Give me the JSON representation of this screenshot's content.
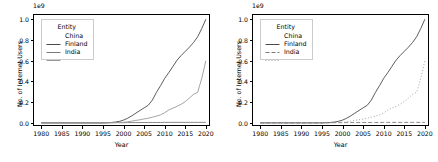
{
  "figure": {
    "panels": [
      {
        "name": "left-panel",
        "style_mode": "all-solid"
      },
      {
        "name": "right-panel",
        "style_mode": "per-entity-dash"
      }
    ]
  },
  "legend": {
    "title": "Entity",
    "entries": [
      {
        "label": "China",
        "color": "#4a4a4a",
        "dash_left": "none",
        "dash_right": "none"
      },
      {
        "label": "Finland",
        "color": "#7a7a7a",
        "dash_left": "none",
        "dash_right": "4,2"
      },
      {
        "label": "India",
        "color": "#9a9a9a",
        "dash_left": "none",
        "dash_right": "1,2"
      }
    ]
  },
  "chart_data": {
    "type": "line",
    "title": "",
    "xlabel": "Year",
    "ylabel": "No. of Internet Users",
    "y_offset_text": "1e9",
    "y_scale": 1000000000,
    "xlim": [
      1978,
      2021
    ],
    "ylim": [
      -0.03,
      1.05
    ],
    "grid": false,
    "legend_position": "upper left",
    "xticks": [
      1980,
      1985,
      1990,
      1995,
      2000,
      2005,
      2010,
      2015,
      2020
    ],
    "xtick_labels": [
      "1980",
      "1985",
      "1990",
      "1995",
      "2000",
      "2005",
      "2010",
      "2015",
      "2020"
    ],
    "yticks": [
      0.0,
      0.2,
      0.4,
      0.6,
      0.8,
      1.0
    ],
    "ytick_labels": [
      "0.0",
      "0.2",
      "0.4",
      "0.6",
      "0.8",
      "1.0"
    ],
    "x": [
      1980,
      1985,
      1990,
      1995,
      1996,
      1997,
      1998,
      1999,
      2000,
      2001,
      2002,
      2003,
      2004,
      2005,
      2006,
      2007,
      2008,
      2009,
      2010,
      2011,
      2012,
      2013,
      2014,
      2015,
      2016,
      2017,
      2018,
      2019,
      2020
    ],
    "series": [
      {
        "name": "China",
        "values": [
          0.0,
          0.0,
          0.0,
          0.0,
          0.002,
          0.004,
          0.008,
          0.015,
          0.027,
          0.045,
          0.068,
          0.094,
          0.12,
          0.145,
          0.17,
          0.22,
          0.295,
          0.36,
          0.43,
          0.485,
          0.545,
          0.605,
          0.65,
          0.69,
          0.73,
          0.775,
          0.83,
          0.91,
          1.0
        ]
      },
      {
        "name": "Finland",
        "values": [
          0.0,
          0.0,
          0.0,
          0.0,
          0.001,
          0.001,
          0.002,
          0.002,
          0.002,
          0.003,
          0.003,
          0.003,
          0.003,
          0.004,
          0.004,
          0.004,
          0.004,
          0.004,
          0.005,
          0.005,
          0.005,
          0.005,
          0.005,
          0.005,
          0.005,
          0.005,
          0.005,
          0.005,
          0.005
        ]
      },
      {
        "name": "India",
        "values": [
          0.0,
          0.0,
          0.0,
          0.0,
          0.001,
          0.002,
          0.003,
          0.004,
          0.006,
          0.01,
          0.017,
          0.024,
          0.03,
          0.038,
          0.045,
          0.055,
          0.065,
          0.078,
          0.098,
          0.125,
          0.142,
          0.16,
          0.18,
          0.205,
          0.24,
          0.275,
          0.295,
          0.43,
          0.6
        ]
      }
    ]
  }
}
